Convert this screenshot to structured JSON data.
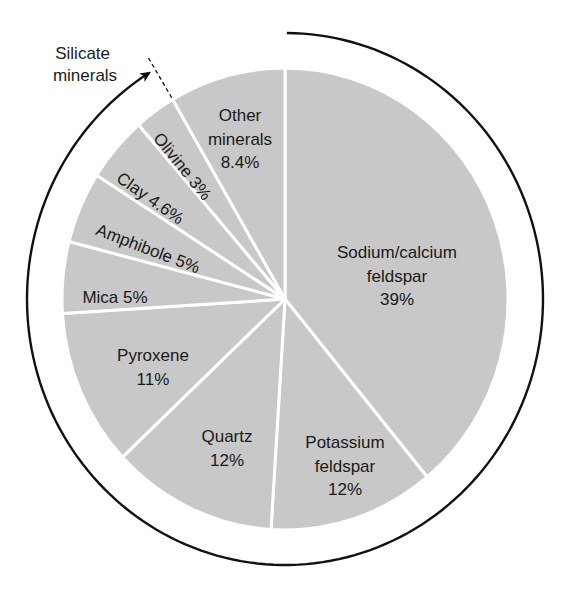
{
  "chart_data": {
    "type": "pie",
    "title": "",
    "start_angle_deg": 0,
    "direction": "clockwise",
    "slices": [
      {
        "label": "Sodium/calcium feldspar",
        "value": 39,
        "display": [
          "Sodium/calcium",
          "feldspar",
          "39%"
        ]
      },
      {
        "label": "Potassium feldspar",
        "value": 12,
        "display": [
          "Potassium",
          "feldspar",
          "12%"
        ]
      },
      {
        "label": "Quartz",
        "value": 12,
        "display": [
          "Quartz",
          "12%"
        ]
      },
      {
        "label": "Pyroxene",
        "value": 11,
        "display": [
          "Pyroxene",
          "11%"
        ]
      },
      {
        "label": "Mica",
        "value": 5,
        "display": [
          "Mica 5%"
        ]
      },
      {
        "label": "Amphibole",
        "value": 5,
        "display": [
          "Amphibole 5%"
        ]
      },
      {
        "label": "Clay",
        "value": 4.6,
        "display": [
          "Clay 4.6%"
        ]
      },
      {
        "label": "Olivine",
        "value": 3,
        "display": [
          "Olivine 3%"
        ]
      },
      {
        "label": "Other minerals",
        "value": 8.4,
        "display": [
          "Other",
          "minerals",
          "8.4%"
        ]
      }
    ],
    "annotations": [
      {
        "text": "Silicate minerals",
        "lines": [
          "Silicate",
          "minerals"
        ],
        "note": "Arrow spans all silicate slices (all except Other minerals)"
      }
    ]
  },
  "style": {
    "slice_fill": "#c8c8c8",
    "separator": "#ffffff",
    "text_color": "#1a1a1a",
    "arc_color": "#111111"
  },
  "layout": {
    "center": [
      285,
      299
    ],
    "rx": 223,
    "ry": 231,
    "arc_rx": 258,
    "arc_ry": 266,
    "labels": [
      {
        "x": 397,
        "y": 258,
        "rot": 0,
        "size": 17
      },
      {
        "x": 345,
        "y": 448,
        "rot": 0,
        "size": 17
      },
      {
        "x": 227,
        "y": 442,
        "rot": 0,
        "size": 17
      },
      {
        "x": 153,
        "y": 361,
        "rot": 0,
        "size": 17
      },
      {
        "x": 115,
        "y": 303,
        "rot": 0,
        "size": 17
      },
      {
        "x": 146,
        "y": 254,
        "rot": 21,
        "size": 17
      },
      {
        "x": 147,
        "y": 203,
        "rot": 35,
        "size": 17
      },
      {
        "x": 178,
        "y": 170,
        "rot": 51,
        "size": 17
      },
      {
        "x": 240,
        "y": 121,
        "rot": 0,
        "size": 17
      }
    ],
    "annotation_label": {
      "x": 85,
      "y": 59,
      "size": 17
    }
  }
}
